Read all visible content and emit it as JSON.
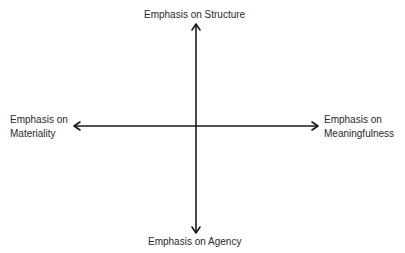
{
  "diagram": {
    "type": "two-axis quadrant diagram",
    "axes": {
      "vertical": {
        "top": "Emphasis on Structure",
        "bottom": "Emphasis on Agency"
      },
      "horizontal": {
        "left": [
          "Emphasis on",
          "Materiality"
        ],
        "right": [
          "Emphasis on",
          "Meaningfulness"
        ]
      }
    },
    "colors": {
      "line": "#1a1a1a",
      "text": "#2a2a2a"
    }
  }
}
